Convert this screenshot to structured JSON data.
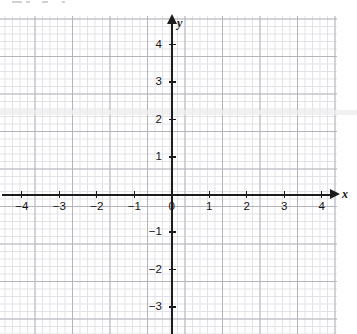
{
  "chart_data": {
    "type": "line",
    "title": "",
    "subtitle": "",
    "xlabel": "x",
    "ylabel": "y",
    "xlim": [
      -4.55,
      4.4
    ],
    "ylim": [
      -3.6,
      4.65
    ],
    "grid": true,
    "minor_grid": true,
    "major_grid_step": 1,
    "minor_grid_step": 0.2,
    "legend": null,
    "annotations": [],
    "series": [],
    "x_ticks": [
      {
        "value": -4,
        "label": "−4"
      },
      {
        "value": -3,
        "label": "−3"
      },
      {
        "value": -2,
        "label": "−2"
      },
      {
        "value": -1,
        "label": "−1"
      },
      {
        "value": 0,
        "label": "0"
      },
      {
        "value": 1,
        "label": "1"
      },
      {
        "value": 2,
        "label": "2"
      },
      {
        "value": 3,
        "label": "3"
      },
      {
        "value": 4,
        "label": "4"
      }
    ],
    "y_ticks": [
      {
        "value": 4,
        "label": "4"
      },
      {
        "value": 3,
        "label": "3"
      },
      {
        "value": 2,
        "label": "2"
      },
      {
        "value": 1,
        "label": "1"
      },
      {
        "value": -1,
        "label": "−1"
      },
      {
        "value": -2,
        "label": "−2"
      },
      {
        "value": -3,
        "label": "−3"
      }
    ],
    "colors": {
      "axis": "#1c1c1c",
      "major_grid": "#b4b4ba",
      "minor_grid": "#e2e2e6",
      "background": "#ffffff",
      "tick_label": "#141414"
    }
  },
  "axes": {
    "x_axis_label": "x",
    "y_axis_label": "y",
    "origin_label": "0"
  }
}
